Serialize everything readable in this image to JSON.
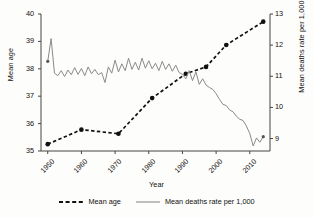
{
  "chart_data": {
    "type": "line",
    "title": "",
    "xlabel": "Year",
    "ylabel": "Mean age",
    "ylabel_right": "Mean deaths rate per 1,000",
    "xlim": [
      1948,
      2016
    ],
    "ylim": [
      35,
      40
    ],
    "ylim_right": [
      8.6,
      13
    ],
    "grid": false,
    "legend_position": "bottom",
    "xticks": [
      "1950",
      "1960",
      "1970",
      "1980",
      "1990",
      "2000",
      "2010"
    ],
    "xtick_values": [
      1950,
      1960,
      1970,
      1980,
      1990,
      2000,
      2010
    ],
    "yticks_left": [
      "35",
      "36",
      "37",
      "38",
      "39",
      "40"
    ],
    "ytick_values_left": [
      35,
      36,
      37,
      38,
      39,
      40
    ],
    "yticks_right": [
      "9",
      "10",
      "11",
      "12",
      "13"
    ],
    "ytick_values_right": [
      9,
      10,
      11,
      12,
      13
    ],
    "series": [
      {
        "name": "Mean age",
        "axis": "left",
        "style": "dashed",
        "marker": "circle",
        "color": "#111111",
        "x": [
          1950,
          1960,
          1971,
          1981,
          1991,
          1997,
          2003,
          2014
        ],
        "values": [
          35.25,
          35.78,
          35.63,
          36.93,
          37.82,
          38.07,
          38.87,
          39.72
        ]
      },
      {
        "name": "Mean deaths rate per 1,000",
        "axis": "right",
        "style": "solid",
        "marker": "none",
        "color": "#8a8a8a",
        "x": [
          1950,
          1951,
          1952,
          1953,
          1954,
          1955,
          1956,
          1957,
          1958,
          1959,
          1960,
          1961,
          1962,
          1963,
          1964,
          1965,
          1966,
          1967,
          1968,
          1969,
          1970,
          1971,
          1972,
          1973,
          1974,
          1975,
          1976,
          1977,
          1978,
          1979,
          1980,
          1981,
          1982,
          1983,
          1984,
          1985,
          1986,
          1987,
          1988,
          1989,
          1990,
          1991,
          1992,
          1993,
          1994,
          1995,
          1996,
          1997,
          1998,
          1999,
          2000,
          2001,
          2002,
          2003,
          2004,
          2005,
          2006,
          2007,
          2008,
          2009,
          2010,
          2011,
          2012,
          2013,
          2014
        ],
        "values": [
          11.48,
          12.21,
          11.1,
          11.02,
          11.18,
          10.99,
          11.2,
          11.05,
          11.28,
          11.06,
          11.25,
          11.02,
          11.3,
          11.08,
          11.22,
          11.05,
          11.12,
          10.8,
          11.3,
          11.1,
          11.52,
          11.14,
          11.4,
          11.18,
          11.58,
          11.22,
          11.45,
          11.2,
          11.58,
          11.26,
          11.5,
          11.24,
          11.42,
          11.18,
          11.48,
          11.22,
          11.4,
          11.16,
          11.36,
          11.12,
          11.06,
          10.92,
          11.18,
          10.86,
          11.14,
          10.74,
          10.92,
          10.72,
          10.64,
          10.58,
          10.44,
          10.26,
          10.1,
          10.06,
          9.92,
          9.86,
          9.72,
          9.62,
          9.58,
          9.4,
          9.16,
          8.76,
          9.02,
          8.88,
          9.06
        ]
      }
    ]
  },
  "legend": {
    "items": [
      {
        "label": "Mean age",
        "style": "dashed",
        "color": "#111111"
      },
      {
        "label": "Mean deaths rate per 1,000",
        "style": "solid",
        "color": "#8a8a8a"
      }
    ]
  }
}
